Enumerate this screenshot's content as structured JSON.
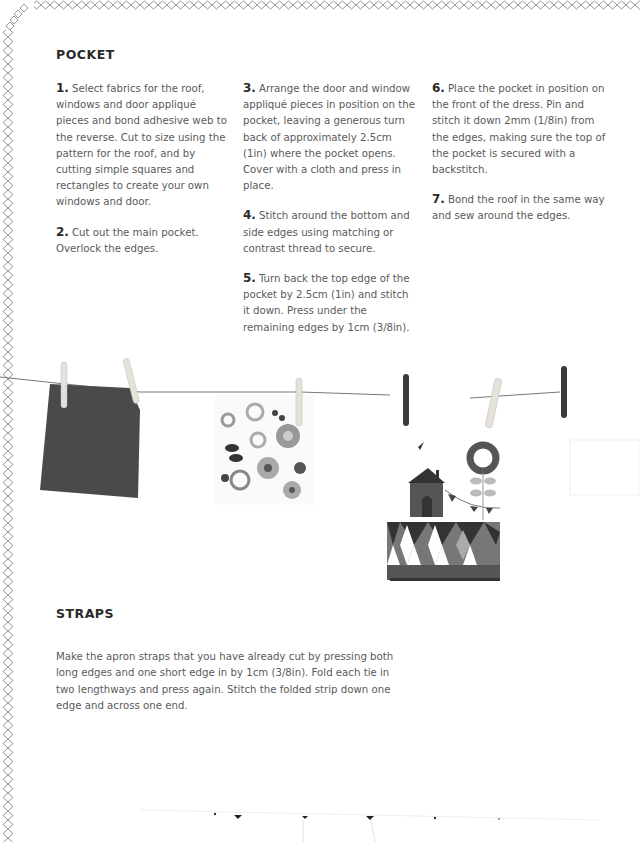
{
  "pocket": {
    "heading": "POCKET",
    "steps": [
      {
        "num": "1.",
        "text": "Select fabrics for the roof, windows and door appliqué pieces and bond adhesive web to the reverse.  Cut to size using the pattern for the roof, and by cutting simple squares and rectangles to create your own windows and door."
      },
      {
        "num": "2.",
        "text": "Cut out the main pocket. Overlock the edges."
      },
      {
        "num": "3.",
        "text": "Arrange the door and window appliqué pieces in position on the pocket, leaving a generous turn back of approximately 2.5cm (1in) where the pocket opens. Cover with a cloth and press in place."
      },
      {
        "num": "4.",
        "text": "Stitch around the bottom and side edges using matching or contrast thread to secure."
      },
      {
        "num": "5.",
        "text": "Turn back the top edge of the pocket by 2.5cm (1in) and stitch it down. Press under the remaining edges by 1cm (3/8in)."
      },
      {
        "num": "6.",
        "text": "Place the pocket in position on the front of the dress. Pin and stitch it down 2mm (1/8in) from the edges, making sure the top of the pocket is secured with a backstitch."
      },
      {
        "num": "7.",
        "text": "Bond the roof in the same way and sew around the edges."
      }
    ]
  },
  "straps": {
    "heading": "STRAPS",
    "text": "Make the apron straps that you have already cut by pressing both long edges and one short edge in by 1cm (3/8in). Fold each tie in two lengthways and press again. Stitch the folded strip down one edge and across one end."
  },
  "illustration": {
    "description": "Fabric pieces pegged on a washing line: dark plain square, floral print, house-and-flower appliqué pocket with harlequin pattern, blank white piece",
    "colors": {
      "dark_fabric": "#4a4a4a",
      "peg_light": "#e8e4dc",
      "peg_dark": "#3a3a3a",
      "line": "#777777"
    }
  }
}
